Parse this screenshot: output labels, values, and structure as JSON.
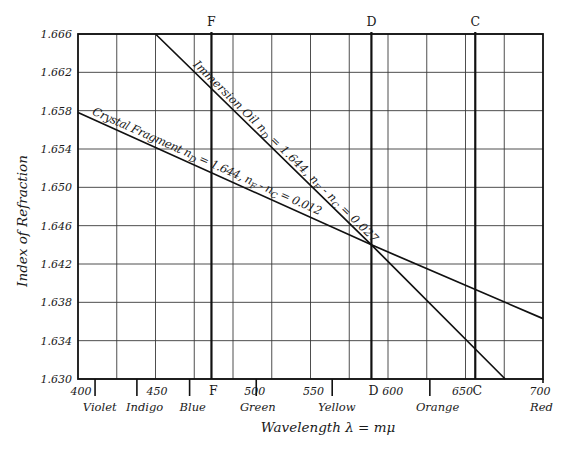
{
  "chart_data": {
    "type": "line",
    "title": "",
    "xlabel": "Wavelength  λ = mμ",
    "ylabel": "Index of Refraction",
    "xlim": [
      400,
      700
    ],
    "ylim": [
      1.63,
      1.666
    ],
    "grid": true,
    "x_gridlines": [
      425,
      450,
      475,
      500,
      525,
      550,
      575,
      600,
      625,
      650,
      675
    ],
    "y_ticks": [
      1.63,
      1.634,
      1.638,
      1.642,
      1.646,
      1.65,
      1.654,
      1.658,
      1.662,
      1.666
    ],
    "y_tick_labels": [
      "1.630",
      "1.634",
      "1.638",
      "1.642",
      "1.646",
      "1.650",
      "1.654",
      "1.658",
      "1.662",
      "1.666"
    ],
    "x_tick_labels": [
      {
        "label": "400",
        "at": 402
      },
      {
        "label": "450",
        "at": 451
      },
      {
        "label": "500",
        "at": 514
      },
      {
        "label": "550",
        "at": 552
      },
      {
        "label": "600",
        "at": 603
      },
      {
        "label": "650",
        "at": 648
      },
      {
        "label": "700",
        "at": 698
      }
    ],
    "color_band_ticks": [
      411,
      438,
      472,
      515,
      564,
      627
    ],
    "color_bands": [
      {
        "label": "Violet",
        "at": 414
      },
      {
        "label": "Indigo",
        "at": 443
      },
      {
        "label": "Blue",
        "at": 474
      },
      {
        "label": "Green",
        "at": 516
      },
      {
        "label": "Yellow",
        "at": 567
      },
      {
        "label": "Orange",
        "at": 632
      },
      {
        "label": "Red",
        "at": 699
      }
    ],
    "fraunhofer_lines": [
      {
        "label": "F",
        "wavelength": 486.1
      },
      {
        "label": "D",
        "wavelength": 589.3
      },
      {
        "label": "C",
        "wavelength": 656.3
      }
    ],
    "series": [
      {
        "name": "Immersion Oil",
        "x": [
          450,
          589.3,
          675.6
        ],
        "y": [
          1.666,
          1.644,
          1.63
        ],
        "annotation": {
          "parts": [
            {
              "t": "Immersion Oil  n"
            },
            {
              "sub": "D"
            },
            {
              "t": " = 1.644, n"
            },
            {
              "sub": "F"
            },
            {
              "t": " - n"
            },
            {
              "sub": "C"
            },
            {
              "t": " = 0.027"
            }
          ],
          "start": [
            190,
            68
          ],
          "end": [
            371,
            246
          ],
          "offset": 4
        }
      },
      {
        "name": "Crystal Fragment",
        "x": [
          400,
          589.3,
          700
        ],
        "y": [
          1.6578,
          1.644,
          1.6363
        ],
        "annotation": {
          "parts": [
            {
              "t": "Crystal Fragment n"
            },
            {
              "sub": "D"
            },
            {
              "t": " = 1.644, n"
            },
            {
              "sub": "F"
            },
            {
              "t": " - n"
            },
            {
              "sub": "C"
            },
            {
              "t": " = 0.012"
            }
          ],
          "start": [
            90,
            118
          ],
          "end": [
            318,
            219
          ],
          "offset": 4
        }
      }
    ]
  }
}
